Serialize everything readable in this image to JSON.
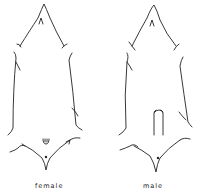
{
  "figure": {
    "panels": [
      {
        "label": "female"
      },
      {
        "label": "male"
      }
    ],
    "stroke_color": "#222222"
  }
}
